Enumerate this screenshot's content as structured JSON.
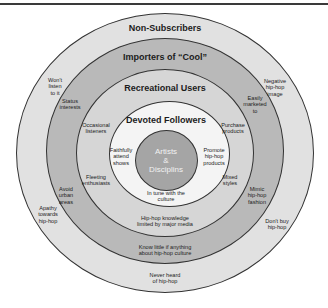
{
  "colors": {
    "non_subscribers": "#e1e1e1",
    "importers": "#b9b9b9",
    "recreational": "#d6d6d6",
    "devoted": "#f4f4f4",
    "core": "#a5a5a5",
    "stroke": "#333333"
  },
  "rings": {
    "non_subscribers": {
      "title": "Non-Subscribers",
      "notes": [
        {
          "lines": [
            "Won't",
            "listen",
            "to it"
          ]
        },
        {
          "lines": [
            "Negative",
            "hip-hop",
            "image"
          ]
        },
        {
          "lines": [
            "Apathy",
            "towards",
            "hip-hop"
          ]
        },
        {
          "lines": [
            "Don't buy",
            "hip-hop"
          ]
        },
        {
          "lines": [
            "Never heard",
            "of hip-hop"
          ]
        }
      ]
    },
    "importers": {
      "title": "Importers of “Cool”",
      "notes": [
        {
          "lines": [
            "Status",
            "interests"
          ]
        },
        {
          "lines": [
            "Easily",
            "marketed",
            "to"
          ]
        },
        {
          "lines": [
            "Avoid",
            "urban",
            "areas"
          ]
        },
        {
          "lines": [
            "Mimic",
            "hip-hop",
            "fashion"
          ]
        },
        {
          "lines": [
            "Know little if anything",
            "about hip-hop culture"
          ]
        }
      ]
    },
    "recreational": {
      "title": "Recreational Users",
      "notes": [
        {
          "lines": [
            "Occasional",
            "listeners"
          ]
        },
        {
          "lines": [
            "Purchase",
            "products"
          ]
        },
        {
          "lines": [
            "Fleeting",
            "enthusiasts"
          ]
        },
        {
          "lines": [
            "Mixed",
            "styles"
          ]
        },
        {
          "lines": [
            "Hip-hop knowledge",
            "limited by major media"
          ]
        }
      ]
    },
    "devoted": {
      "title": "Devoted Followers",
      "notes": [
        {
          "lines": [
            "Faithfully",
            "attend",
            "shows"
          ]
        },
        {
          "lines": [
            "Promote",
            "hip-hop",
            "products"
          ]
        },
        {
          "lines": [
            "In tune with the",
            "culture"
          ]
        }
      ]
    },
    "core": {
      "lines": [
        "Artists",
        "&",
        "Disciplins"
      ]
    }
  }
}
